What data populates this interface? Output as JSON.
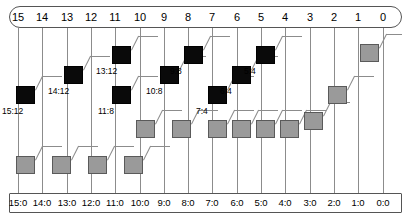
{
  "diagram": {
    "colors": {
      "black_node": "#0a0a0a",
      "gray_node": "#9a9a9a",
      "line": "#8c8c8c",
      "frame": "#555555"
    },
    "top_frame": {
      "labels": [
        "15",
        "14",
        "13",
        "12",
        "11",
        "10",
        "9",
        "8",
        "7",
        "6",
        "5",
        "4",
        "3",
        "2",
        "1",
        "0"
      ]
    },
    "bottom_frame": {
      "labels": [
        "15:0",
        "14:0",
        "13:0",
        "12:0",
        "11:0",
        "10:0",
        "9:0",
        "8:0",
        "7:0",
        "6:0",
        "5:0",
        "4:0",
        "3:0",
        "2:0",
        "1:0",
        "0:0"
      ]
    },
    "nodes": [
      {
        "id": "n-15-12",
        "label": "15:12",
        "kind": "black",
        "col": 15,
        "x": 16,
        "y": 86,
        "label_x": 2,
        "label_y": 106,
        "diag_to_x": 42,
        "diag_to_y": 76,
        "h_to_x": 62
      },
      {
        "id": "n-14-12",
        "label": "14:12",
        "kind": "black",
        "col": 13,
        "x": 64,
        "y": 66,
        "label_x": 48,
        "label_y": 86,
        "diag_to_x": 90,
        "diag_to_y": 56,
        "h_to_x": 110
      },
      {
        "id": "n-13-12",
        "label": "13:12",
        "kind": "black",
        "col": 11,
        "x": 112,
        "y": 46,
        "label_x": 96,
        "label_y": 66,
        "diag_to_x": 138,
        "diag_to_y": 36,
        "h_to_x": 158
      },
      {
        "id": "n-11-8",
        "label": "11:8",
        "kind": "black",
        "col": 9,
        "x": 112,
        "y": 86,
        "label_x": 98,
        "label_y": 106,
        "diag_to_x": 138,
        "diag_to_y": 76,
        "h_to_x": 158
      },
      {
        "id": "n-10-8",
        "label": "10:8",
        "kind": "black",
        "col": 7,
        "x": 160,
        "y": 66,
        "label_x": 146,
        "label_y": 86,
        "diag_to_x": 186,
        "diag_to_y": 56,
        "h_to_x": 206
      },
      {
        "id": "n-9-8",
        "label": "9:8",
        "kind": "black",
        "col": 5,
        "x": 184,
        "y": 46,
        "label_x": 170,
        "label_y": 66,
        "diag_to_x": 210,
        "diag_to_y": 36,
        "h_to_x": 230
      },
      {
        "id": "n-7-4",
        "label": "7:4",
        "kind": "black",
        "col": 3,
        "x": 208,
        "y": 86,
        "label_x": 196,
        "label_y": 106,
        "diag_to_x": 234,
        "diag_to_y": 76,
        "h_to_x": 254
      },
      {
        "id": "n-6-4",
        "label": "6:4",
        "kind": "black",
        "col": 2,
        "x": 232,
        "y": 66,
        "label_x": 220,
        "label_y": 86,
        "diag_to_x": 258,
        "diag_to_y": 56,
        "h_to_x": 278
      },
      {
        "id": "n-5-4",
        "label": "5:4",
        "kind": "black",
        "col": 1,
        "x": 256,
        "y": 46,
        "label_x": 244,
        "label_y": 66,
        "diag_to_x": 282,
        "diag_to_y": 36,
        "h_to_x": 302
      },
      {
        "id": "n-g1",
        "label": "",
        "kind": "gray",
        "col": 0,
        "x": 304,
        "y": 112,
        "label_x": 0,
        "label_y": 0,
        "diag_to_x": 330,
        "diag_to_y": 102,
        "h_to_x": 350
      },
      {
        "id": "n-g2",
        "label": "",
        "kind": "gray",
        "col": 0,
        "x": 328,
        "y": 86,
        "label_x": 0,
        "label_y": 0,
        "diag_to_x": 354,
        "diag_to_y": 76,
        "h_to_x": 374
      },
      {
        "id": "n-g3",
        "label": "",
        "kind": "gray",
        "col": 0,
        "x": 360,
        "y": 44,
        "label_x": 0,
        "label_y": 0,
        "diag_to_x": 386,
        "diag_to_y": 34,
        "h_to_x": 402
      },
      {
        "id": "n-g4",
        "label": "",
        "kind": "gray",
        "col": 0,
        "x": 16,
        "y": 156,
        "label_x": 0,
        "label_y": 0,
        "diag_to_x": 42,
        "diag_to_y": 146,
        "h_to_x": 62
      },
      {
        "id": "n-g5",
        "label": "",
        "kind": "gray",
        "col": 0,
        "x": 52,
        "y": 156,
        "label_x": 0,
        "label_y": 0,
        "diag_to_x": 78,
        "diag_to_y": 146,
        "h_to_x": 98
      },
      {
        "id": "n-g6",
        "label": "",
        "kind": "gray",
        "col": 0,
        "x": 88,
        "y": 156,
        "label_x": 0,
        "label_y": 0,
        "diag_to_x": 114,
        "diag_to_y": 146,
        "h_to_x": 134
      },
      {
        "id": "n-g7",
        "label": "",
        "kind": "gray",
        "col": 0,
        "x": 124,
        "y": 156,
        "label_x": 0,
        "label_y": 0,
        "diag_to_x": 150,
        "diag_to_y": 146,
        "h_to_x": 170
      },
      {
        "id": "n-g8",
        "label": "",
        "kind": "gray",
        "col": 0,
        "x": 136,
        "y": 120,
        "label_x": 0,
        "label_y": 0,
        "diag_to_x": 162,
        "diag_to_y": 110,
        "h_to_x": 182
      },
      {
        "id": "n-g9",
        "label": "",
        "kind": "gray",
        "col": 0,
        "x": 172,
        "y": 120,
        "label_x": 0,
        "label_y": 0,
        "diag_to_x": 198,
        "diag_to_y": 110,
        "h_to_x": 218
      },
      {
        "id": "n-g10",
        "label": "",
        "kind": "gray",
        "col": 0,
        "x": 208,
        "y": 120,
        "label_x": 0,
        "label_y": 0,
        "diag_to_x": 234,
        "diag_to_y": 110,
        "h_to_x": 254
      },
      {
        "id": "n-g11",
        "label": "",
        "kind": "gray",
        "col": 0,
        "x": 232,
        "y": 120,
        "label_x": 0,
        "label_y": 0,
        "diag_to_x": 258,
        "diag_to_y": 110,
        "h_to_x": 278
      },
      {
        "id": "n-g12",
        "label": "",
        "kind": "gray",
        "col": 0,
        "x": 256,
        "y": 120,
        "label_x": 0,
        "label_y": 0,
        "diag_to_x": 282,
        "diag_to_y": 110,
        "h_to_x": 302
      },
      {
        "id": "n-g13",
        "label": "",
        "kind": "gray",
        "col": 0,
        "x": 280,
        "y": 120,
        "label_x": 0,
        "label_y": 0,
        "diag_to_x": 306,
        "diag_to_y": 110,
        "h_to_x": 326
      }
    ]
  }
}
